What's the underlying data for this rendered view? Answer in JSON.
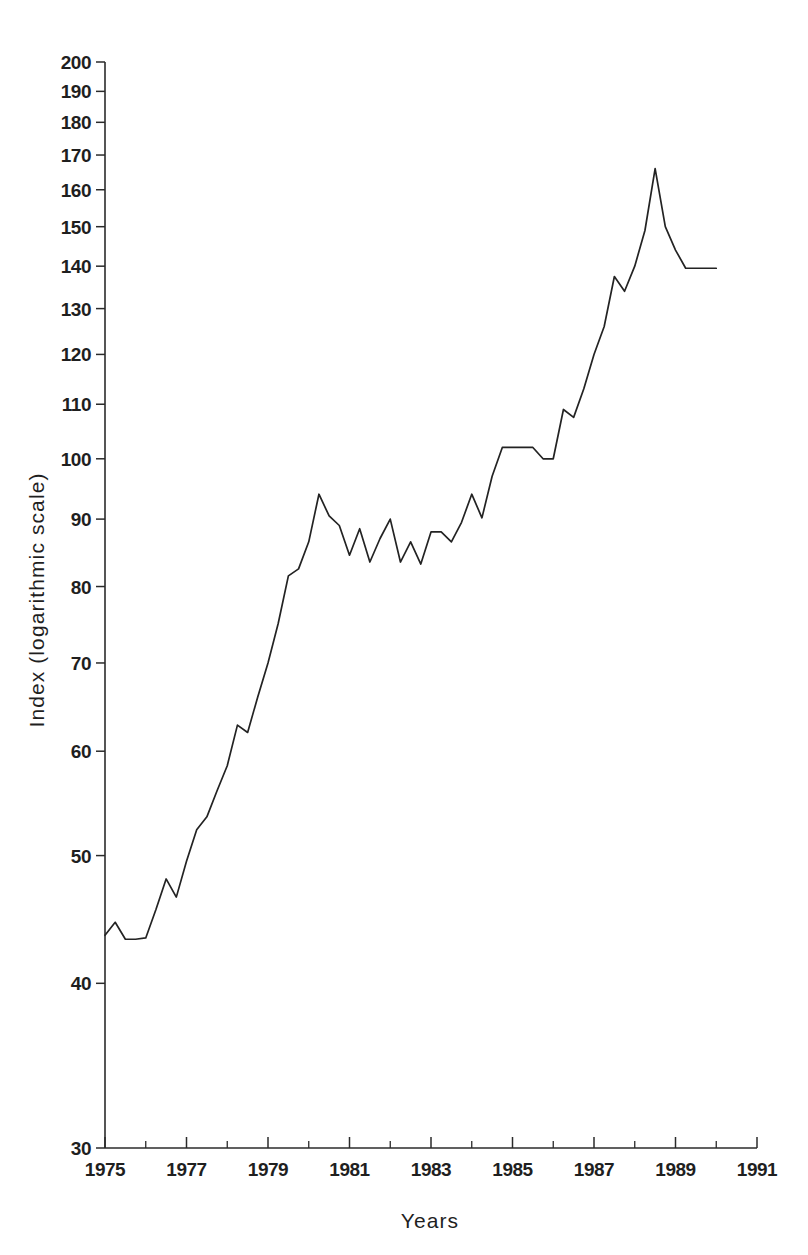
{
  "chart_data": {
    "type": "line",
    "title": "",
    "subtitle": "",
    "xlabel": "Years",
    "ylabel": "Index (logarithmic scale)",
    "yscale": "log",
    "ylim": [
      30,
      200
    ],
    "xlim": [
      1975,
      1991
    ],
    "grid": false,
    "legend": null,
    "y_major_ticks": [
      30,
      40,
      50,
      60,
      70,
      80,
      90,
      100,
      110,
      120,
      130,
      140,
      150,
      160,
      170,
      180,
      190,
      200
    ],
    "y_tick_labels": [
      "30",
      "40",
      "50",
      "60",
      "70",
      "80",
      "90",
      "100",
      "110",
      "120",
      "130",
      "140",
      "150",
      "160",
      "170",
      "180",
      "190",
      "200"
    ],
    "x_major_ticks": [
      1975,
      1977,
      1979,
      1981,
      1983,
      1985,
      1987,
      1989,
      1991
    ],
    "x_tick_labels": [
      "1975",
      "1977",
      "1979",
      "1981",
      "1983",
      "1985",
      "1987",
      "1989",
      "1991"
    ],
    "x_minor_ticks": [
      1976,
      1978,
      1980,
      1982,
      1984,
      1986,
      1988,
      1990
    ],
    "line_color": "#232323",
    "series": [
      {
        "name": "Index",
        "x": [
          1975.0,
          1975.25,
          1975.5,
          1975.75,
          1976.0,
          1976.25,
          1976.5,
          1976.75,
          1977.0,
          1977.25,
          1977.5,
          1977.75,
          1978.0,
          1978.25,
          1978.5,
          1978.75,
          1979.0,
          1979.25,
          1979.5,
          1979.75,
          1980.0,
          1980.25,
          1980.5,
          1980.75,
          1981.0,
          1981.25,
          1981.5,
          1981.75,
          1982.0,
          1982.25,
          1982.5,
          1982.75,
          1983.0,
          1983.25,
          1983.5,
          1983.75,
          1984.0,
          1984.25,
          1984.5,
          1984.75,
          1985.0,
          1985.25,
          1985.5,
          1985.75,
          1986.0,
          1986.25,
          1986.5,
          1986.75,
          1987.0,
          1987.25,
          1987.5,
          1987.75,
          1988.0,
          1988.25,
          1988.5,
          1988.75,
          1989.0,
          1989.25,
          1989.5,
          1989.75,
          1990.0
        ],
        "values": [
          43.5,
          44.5,
          43.2,
          43.2,
          43.3,
          45.5,
          48.0,
          46.5,
          49.5,
          52.3,
          53.5,
          56.0,
          58.5,
          62.8,
          62.0,
          66.0,
          70.0,
          75.0,
          81.5,
          82.5,
          86.5,
          94.0,
          90.5,
          89.0,
          84.5,
          88.5,
          83.5,
          87.0,
          90.0,
          83.5,
          86.5,
          83.2,
          88.0,
          88.0,
          86.5,
          89.5,
          94.0,
          90.2,
          97.0,
          102.0,
          102.0,
          102.0,
          102.0,
          100.0,
          100.0,
          109.0,
          107.5,
          113.0,
          120.0,
          126.0,
          137.5,
          134.0,
          140.0,
          149.0,
          166.0,
          150.0,
          144.0,
          139.5,
          139.5,
          139.5,
          139.5
        ]
      }
    ]
  },
  "axes": {
    "y_axis_title": "Index (logarithmic scale)",
    "x_axis_title": "Years"
  }
}
